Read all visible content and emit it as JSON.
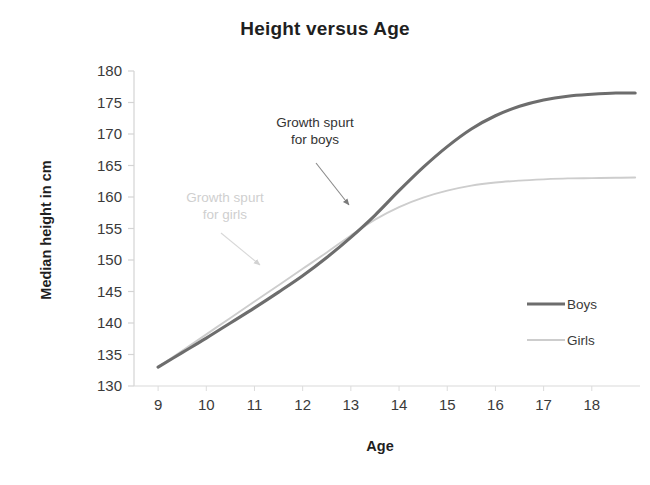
{
  "chart_data": {
    "type": "line",
    "title": "Height versus Age",
    "xlabel": "Age",
    "ylabel": "Median height in cm",
    "xlim": [
      8.5,
      19.0
    ],
    "ylim": [
      130,
      180
    ],
    "xticks": [
      "9",
      "10",
      "11",
      "12",
      "13",
      "14",
      "15",
      "16",
      "17",
      "18"
    ],
    "yticks": [
      "180",
      "175",
      "170",
      "165",
      "160",
      "155",
      "150",
      "145",
      "140",
      "135",
      "130"
    ],
    "grid": false,
    "legend_position": "right",
    "x": [
      9,
      9.5,
      10,
      10.5,
      11,
      11.5,
      12,
      12.5,
      13,
      13.5,
      14,
      14.5,
      15,
      15.5,
      16,
      16.5,
      17,
      17.5,
      18,
      18.5,
      18.9
    ],
    "series": [
      {
        "name": "Boys",
        "color": "#6d6d6d",
        "width": 3.1,
        "values": [
          133.0,
          135.3,
          137.6,
          140.0,
          142.4,
          144.9,
          147.5,
          150.4,
          153.6,
          157.1,
          161.0,
          164.7,
          168.0,
          170.8,
          172.9,
          174.4,
          175.4,
          176.0,
          176.3,
          176.5,
          176.5
        ]
      },
      {
        "name": "Girls",
        "color": "#cdcdcd",
        "width": 1.9,
        "values": [
          133.0,
          135.6,
          138.2,
          140.8,
          143.4,
          146.0,
          148.6,
          151.2,
          153.9,
          156.4,
          158.4,
          159.9,
          161.0,
          161.8,
          162.3,
          162.6,
          162.8,
          162.95,
          163.0,
          163.05,
          163.1
        ]
      }
    ],
    "annotations": [
      {
        "name": "growth-spurt-boys",
        "lines": [
          "Growth spurt",
          "for boys"
        ],
        "color": "#333333",
        "points_to": {
          "x": 13.45,
          "y": 159.5
        }
      },
      {
        "name": "growth-spurt-girls",
        "lines": [
          "Growth spurt",
          "for girls"
        ],
        "color": "#cfcfcf",
        "points_to": {
          "x": 11.6,
          "y": 149.5
        }
      }
    ]
  },
  "legend": {
    "items": [
      {
        "label": "Boys",
        "color": "#6d6d6d"
      },
      {
        "label": "Girls",
        "color": "#cdcdcd"
      }
    ]
  }
}
